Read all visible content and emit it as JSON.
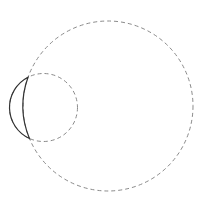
{
  "diagram": {
    "type": "geometric-circles-lune",
    "width": 203,
    "height": 204,
    "background": "#ffffff",
    "large_circle": {
      "cx": 108,
      "cy": 106,
      "r": 85,
      "stroke": "#8a8a8a",
      "dash": "4,3",
      "stroke_width": 1
    },
    "small_circle": {
      "cx": 43.5,
      "cy": 107.5,
      "r": 34,
      "stroke": "#8a8a8a",
      "dash": "4,3",
      "stroke_width": 1
    },
    "lune": {
      "stroke": "#333333",
      "stroke_width": 1.2,
      "top_point": [
        28.7,
        76.9
      ],
      "bottom_point": [
        28.7,
        138.1
      ]
    }
  }
}
